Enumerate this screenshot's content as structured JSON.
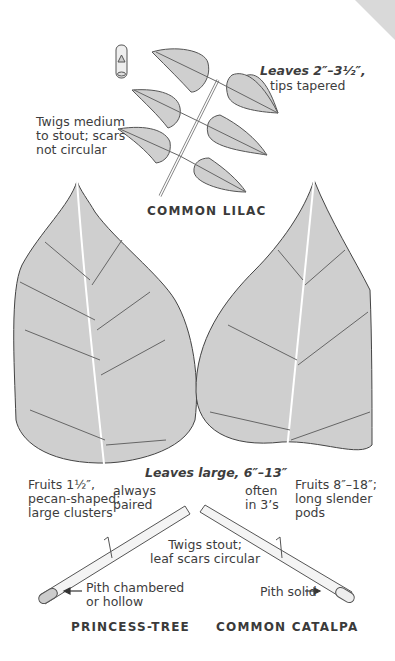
{
  "page": {
    "corner_color": "#d9d9d9",
    "leaf_fill": "#cfcfcf",
    "line_color": "#555555"
  },
  "lilac": {
    "title": "COMMON LILAC",
    "leaves_note_bold": "Leaves 2″–3½″,",
    "leaves_note": "tips tapered",
    "twigs_note": "Twigs medium\nto stout; scars\nnot circular"
  },
  "large_leaves": {
    "leaves_note": "Leaves large, 6″–13″"
  },
  "princess_tree": {
    "title": "PRINCESS-TREE",
    "fruits_note": "Fruits 1½″,\npecan-shaped;\nlarge clusters",
    "leaf_arrangement": "always\npaired",
    "pith_note": "Pith chambered\nor hollow"
  },
  "catalpa": {
    "title": "COMMON CATALPA",
    "fruits_note": "Fruits 8″–18″;\nlong slender\npods",
    "leaf_arrangement": "often\nin 3’s",
    "pith_note": "Pith solid"
  },
  "shared": {
    "twigs_note": "Twigs stout;\nleaf scars circular"
  }
}
